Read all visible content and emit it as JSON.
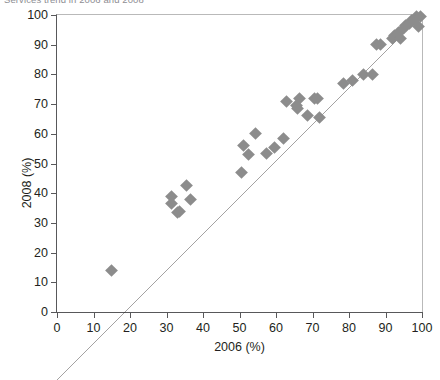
{
  "figure": {
    "title_clipped": "Services trend in 2006 and 2008",
    "marker_color": "#8c8c8c",
    "line_color": "#231f20",
    "frame_color": "#58585a"
  },
  "chart_data": {
    "type": "scatter",
    "title": "Services trend in 2006 and 2008",
    "xlabel": "2006 (%)",
    "ylabel": "2008 (%)",
    "xlim": [
      0,
      100
    ],
    "ylim": [
      0,
      100
    ],
    "xticks": [
      0,
      10,
      20,
      30,
      40,
      50,
      60,
      70,
      80,
      90,
      100
    ],
    "yticks": [
      0,
      10,
      20,
      30,
      40,
      50,
      60,
      70,
      80,
      90,
      100
    ],
    "grid": false,
    "legend": null,
    "reference_line": {
      "label": "identity line (y = x)",
      "from": [
        0,
        0
      ],
      "to": [
        100,
        100
      ]
    },
    "series": [
      {
        "name": "Countries",
        "marker": "diamond",
        "color": "#8c8c8c",
        "points": [
          [
            15,
            14
          ],
          [
            31.5,
            39
          ],
          [
            31.5,
            36.5
          ],
          [
            33,
            33.5
          ],
          [
            33.5,
            34
          ],
          [
            36.5,
            38
          ],
          [
            35.5,
            42.5
          ],
          [
            50.5,
            47
          ],
          [
            51,
            56
          ],
          [
            52.5,
            53
          ],
          [
            54.5,
            60
          ],
          [
            57.5,
            53.5
          ],
          [
            59.5,
            55.5
          ],
          [
            62,
            58.5
          ],
          [
            63,
            71
          ],
          [
            65.5,
            69.5
          ],
          [
            66.5,
            72
          ],
          [
            66,
            68.5
          ],
          [
            68.5,
            66
          ],
          [
            70.5,
            72
          ],
          [
            71.5,
            72
          ],
          [
            72,
            65.5
          ],
          [
            78.5,
            77
          ],
          [
            81,
            78
          ],
          [
            84,
            80
          ],
          [
            86.5,
            80
          ],
          [
            87.5,
            90
          ],
          [
            88.5,
            90
          ],
          [
            92,
            92
          ],
          [
            92.5,
            93
          ],
          [
            93.5,
            94
          ],
          [
            94,
            92
          ],
          [
            95,
            95.5
          ],
          [
            95.5,
            96.5
          ],
          [
            96.5,
            97
          ],
          [
            97,
            98
          ],
          [
            98,
            98.5
          ],
          [
            98.5,
            99.5
          ],
          [
            99.5,
            99.5
          ],
          [
            99,
            96
          ]
        ]
      }
    ]
  }
}
